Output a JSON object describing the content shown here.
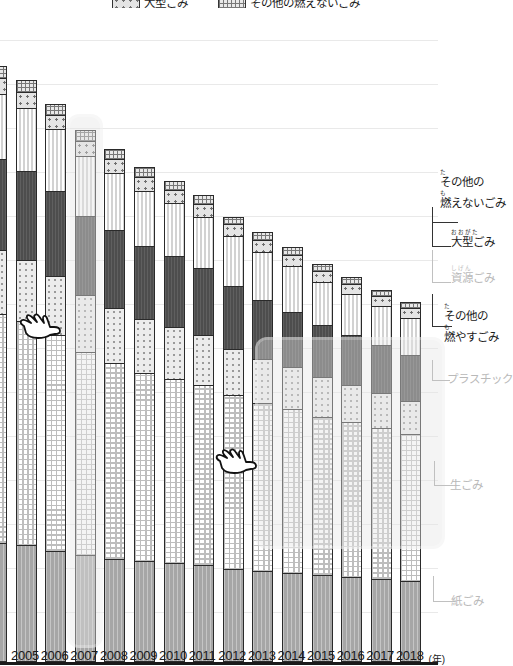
{
  "chart_data": {
    "type": "bar",
    "subtype": "stacked-bar",
    "title": "",
    "xlabel": "(年)",
    "ylabel": "",
    "grid": true,
    "legend_position": "top",
    "categories": [
      "2004",
      "2005",
      "2006",
      "2007",
      "2008",
      "2009",
      "2010",
      "2011",
      "2012",
      "2013",
      "2014",
      "2015",
      "2016",
      "2017",
      "2018"
    ],
    "series": [
      {
        "name": "紙ごみ",
        "key": "kami",
        "pattern": "solid-gray",
        "values": [
          120,
          118,
          112,
          108,
          104,
          102,
          100,
          98,
          94,
          92,
          90,
          88,
          86,
          84,
          82
        ]
      },
      {
        "name": "生ごみ",
        "key": "nama",
        "pattern": "checkered",
        "values": [
          232,
          226,
          218,
          205,
          198,
          190,
          186,
          182,
          176,
          170,
          166,
          160,
          156,
          152,
          148
        ]
      },
      {
        "name": "プラスチック",
        "key": "purasuchikku",
        "pattern": "sparse-dots",
        "values": [
          64,
          62,
          60,
          58,
          56,
          54,
          52,
          50,
          46,
          44,
          42,
          40,
          38,
          36,
          34
        ]
      },
      {
        "name": "その他の燃やすごみ",
        "key": "sonota-moyasu",
        "pattern": "dark-gray",
        "values": [
          92,
          90,
          86,
          80,
          78,
          74,
          72,
          68,
          64,
          60,
          56,
          52,
          50,
          48,
          46
        ]
      },
      {
        "name": "資源ごみ",
        "key": "shigen",
        "pattern": "vertical-stripe",
        "values": [
          66,
          64,
          62,
          60,
          58,
          56,
          54,
          52,
          50,
          48,
          46,
          44,
          42,
          40,
          38
        ]
      },
      {
        "name": "大型ごみ",
        "key": "ogata",
        "pattern": "coarse-dots",
        "values": [
          16,
          16,
          15,
          15,
          14,
          14,
          13,
          13,
          12,
          12,
          11,
          11,
          10,
          10,
          10
        ]
      },
      {
        "name": "その他の燃えないごみ",
        "key": "sonota-moenai",
        "pattern": "cross-hatch",
        "values": [
          12,
          12,
          11,
          11,
          10,
          10,
          9,
          9,
          8,
          8,
          8,
          7,
          7,
          6,
          6
        ]
      }
    ]
  },
  "legend": {
    "items": [
      {
        "label": "大型ごみ",
        "pattern": "coarse-dots"
      },
      {
        "label": "その他の燃えないごみ",
        "pattern": "cross-hatch"
      }
    ]
  },
  "xaxis": {
    "ticks": [
      "4",
      "2005",
      "2006",
      "2007",
      "2008",
      "2009",
      "2010",
      "2011",
      "2012",
      "2013",
      "2014",
      "2015",
      "2016",
      "2017",
      "2018"
    ],
    "unit": "(年)"
  },
  "callouts": [
    {
      "id": "moenai",
      "line1_ruby": "た",
      "line1": "その他の",
      "line2_ruby": "も",
      "line2": "燃えないごみ",
      "dim": false
    },
    {
      "id": "ogata",
      "line1_ruby": "おおがた",
      "line1": "大型ごみ",
      "line2_ruby": "",
      "line2": "",
      "dim": false
    },
    {
      "id": "shigen",
      "line1_ruby": "しげん",
      "line1": "資源ごみ",
      "line2_ruby": "",
      "line2": "",
      "dim": true
    },
    {
      "id": "moyasu",
      "line1_ruby": "た",
      "line1": "その他の",
      "line2_ruby": "も",
      "line2": "燃やすごみ",
      "dim": false
    },
    {
      "id": "purasuchikku",
      "line1_ruby": "",
      "line1": "プラスチック",
      "line2_ruby": "",
      "line2": "",
      "dim": true
    },
    {
      "id": "nama",
      "line1_ruby": "",
      "line1": "生ごみ",
      "line2_ruby": "",
      "line2": "",
      "dim": true
    },
    {
      "id": "kami",
      "line1_ruby": "",
      "line1": "紙ごみ",
      "line2_ruby": "",
      "line2": "",
      "dim": true
    }
  ],
  "cursors": [
    {
      "id": "cursor-left",
      "name": "pointing-hand-cursor"
    },
    {
      "id": "cursor-mid",
      "name": "pointing-hand-cursor"
    }
  ],
  "colors": {
    "kami": "#a6a6a6",
    "nama": "#ffffff",
    "purasuchikku": "#ececec",
    "sonota-moyasu": "#4d4d4d",
    "shigen": "#ededed",
    "ogata": "#e4e4e4",
    "sonota-moenai": "#e8e8e8",
    "axis": "#1a1a1a",
    "grid": "#e9e9e9",
    "highlight": "#e4e4e4"
  }
}
